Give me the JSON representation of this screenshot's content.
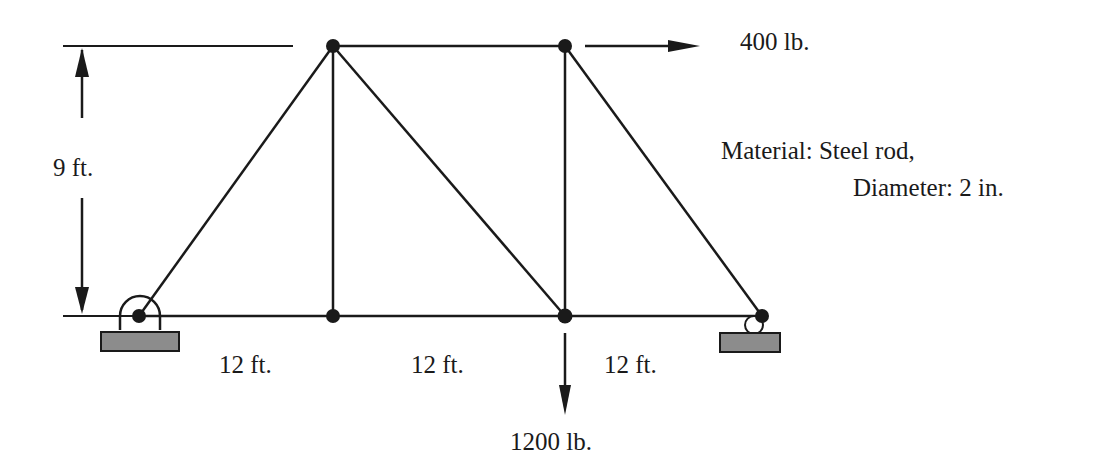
{
  "diagram": {
    "type": "truss",
    "nodes": [
      {
        "id": "A",
        "x": 139,
        "y": 316,
        "desc": "pin support (left)"
      },
      {
        "id": "B",
        "x": 333,
        "y": 316
      },
      {
        "id": "C",
        "x": 565,
        "y": 316
      },
      {
        "id": "D",
        "x": 762,
        "y": 316,
        "desc": "roller support (right)"
      },
      {
        "id": "E",
        "x": 333,
        "y": 46
      },
      {
        "id": "F",
        "x": 565,
        "y": 46
      }
    ],
    "members": [
      [
        "A",
        "E"
      ],
      [
        "E",
        "B"
      ],
      [
        "E",
        "F"
      ],
      [
        "E",
        "C"
      ],
      [
        "F",
        "C"
      ],
      [
        "F",
        "D"
      ],
      [
        "A",
        "B"
      ],
      [
        "B",
        "C"
      ],
      [
        "C",
        "D"
      ]
    ],
    "labels": {
      "height": "9 ft.",
      "span1": "12 ft.",
      "span2": "12 ft.",
      "span3": "12 ft.",
      "horizontal_load": "400 lb.",
      "vertical_load": "1200 lb.",
      "material_line1": "Material: Steel rod,",
      "material_line2": "Diameter: 2 in."
    },
    "colors": {
      "line": "#1a1a1a",
      "support_fill": "#8c8c8c"
    }
  }
}
